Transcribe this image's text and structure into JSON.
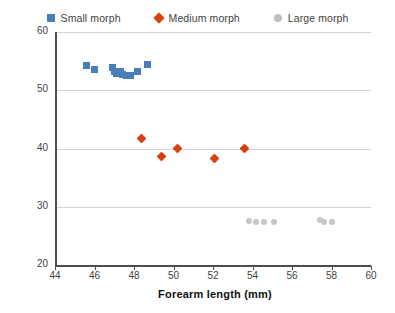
{
  "legend": {
    "position": "top-center",
    "items": [
      {
        "label": "Small morph",
        "marker": "square",
        "color": "#4a7ebb",
        "icon": "square-marker-icon"
      },
      {
        "label": "Medium morph",
        "marker": "diamond",
        "color": "#d9400f",
        "icon": "diamond-marker-icon"
      },
      {
        "label": "Large morph",
        "marker": "circle",
        "color": "#bfbfbf",
        "icon": "circle-marker-icon"
      }
    ]
  },
  "chart_data": {
    "type": "scatter",
    "title": "",
    "xlabel": "Forearm length (mm)",
    "ylabel": "Sound wave frequency (kHz)",
    "xlim": [
      44,
      60
    ],
    "ylim": [
      20,
      60
    ],
    "xticks": [
      44,
      46,
      48,
      50,
      52,
      54,
      56,
      58,
      60
    ],
    "yticks": [
      20,
      30,
      40,
      50,
      60
    ],
    "xtick_labels": [
      "44",
      "46",
      "48",
      "50",
      "52",
      "54",
      "56",
      "58",
      "60"
    ],
    "ytick_labels": [
      "20",
      "30",
      "40",
      "50",
      "60"
    ],
    "grid": "horizontal",
    "series": [
      {
        "name": "Small morph",
        "marker": "square",
        "color": "#4a7ebb",
        "points": [
          {
            "x": 45.6,
            "y": 54.2
          },
          {
            "x": 46.0,
            "y": 53.6
          },
          {
            "x": 46.9,
            "y": 53.9
          },
          {
            "x": 47.0,
            "y": 53.2
          },
          {
            "x": 47.1,
            "y": 52.8
          },
          {
            "x": 47.3,
            "y": 53.3
          },
          {
            "x": 47.4,
            "y": 52.7
          },
          {
            "x": 47.6,
            "y": 52.6
          },
          {
            "x": 47.8,
            "y": 52.6
          },
          {
            "x": 48.2,
            "y": 53.2
          },
          {
            "x": 48.7,
            "y": 54.5
          }
        ]
      },
      {
        "name": "Medium morph",
        "marker": "diamond",
        "color": "#d9400f",
        "points": [
          {
            "x": 48.4,
            "y": 41.8
          },
          {
            "x": 49.4,
            "y": 38.6
          },
          {
            "x": 50.2,
            "y": 40.0
          },
          {
            "x": 52.1,
            "y": 38.2
          },
          {
            "x": 53.6,
            "y": 40.0
          }
        ]
      },
      {
        "name": "Large morph",
        "marker": "circle",
        "color": "#c6c6c6",
        "points": [
          {
            "x": 53.8,
            "y": 27.6
          },
          {
            "x": 54.2,
            "y": 27.3
          },
          {
            "x": 54.6,
            "y": 27.3
          },
          {
            "x": 55.1,
            "y": 27.3
          },
          {
            "x": 57.4,
            "y": 27.8
          },
          {
            "x": 57.6,
            "y": 27.4
          },
          {
            "x": 58.0,
            "y": 27.4
          }
        ]
      }
    ]
  }
}
